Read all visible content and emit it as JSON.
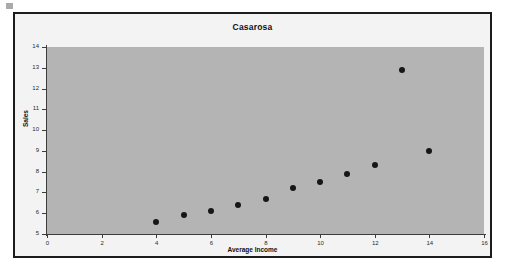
{
  "chart_data": {
    "type": "scatter",
    "title": "Casarosa",
    "xlabel": "Average Income",
    "ylabel": "Sales",
    "xlim": [
      0,
      16
    ],
    "ylim": [
      5,
      14
    ],
    "xticks": [
      0,
      2,
      4,
      6,
      8,
      10,
      12,
      14,
      16
    ],
    "yticks": [
      5,
      6,
      7,
      8,
      9,
      10,
      11,
      12,
      13,
      14
    ],
    "grid": false,
    "legend": null,
    "series": [
      {
        "name": "Casarosa",
        "marker": "filled-circle",
        "color": "#161616",
        "points": [
          {
            "x": 4,
            "y": 5.6
          },
          {
            "x": 5,
            "y": 5.9
          },
          {
            "x": 6,
            "y": 6.1
          },
          {
            "x": 7,
            "y": 6.4
          },
          {
            "x": 8,
            "y": 6.7
          },
          {
            "x": 9,
            "y": 7.2
          },
          {
            "x": 10,
            "y": 7.5
          },
          {
            "x": 11,
            "y": 7.9
          },
          {
            "x": 12,
            "y": 8.3
          },
          {
            "x": 13,
            "y": 12.9
          },
          {
            "x": 14,
            "y": 9.0
          }
        ]
      }
    ],
    "plot_background": "#b4b4b4",
    "chart_background": "#f3f3f3",
    "border_color": "#1c1c1c"
  }
}
